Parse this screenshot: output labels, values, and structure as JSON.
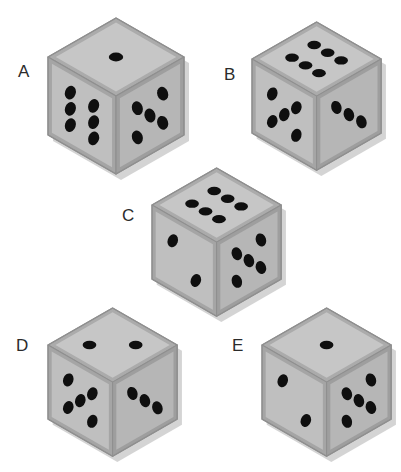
{
  "figure": {
    "type": "dice-set-illustration",
    "background_color": "#ffffff",
    "width": 401,
    "height": 472,
    "label_color": "#2b2b2b",
    "pip_color": "#0f0f0f"
  },
  "palette": {
    "face_top": "#c6c6c6",
    "face_left": "#bfbfbf",
    "face_right": "#b6b6b6",
    "rim_top": "#ababab",
    "rim_left": "#a5a5a5",
    "rim_right": "#9e9e9e",
    "outline": "#8f8f8f",
    "shadow": "#b0b0b0",
    "pip": "#0f0f0f",
    "label": "#2b2b2b"
  },
  "dice": [
    {
      "id": "A",
      "label": "A",
      "label_x": 18,
      "label_y": 63,
      "origin_x": 48,
      "origin_y": 18,
      "scale": 1.0,
      "faces": {
        "top": {
          "pips": 1,
          "name": "one"
        },
        "left": {
          "pips": 6,
          "name": "six"
        },
        "right": {
          "pips": 5,
          "name": "five"
        }
      }
    },
    {
      "id": "B",
      "label": "B",
      "label_x": 224,
      "label_y": 66,
      "origin_x": 252,
      "origin_y": 22,
      "scale": 0.95,
      "faces": {
        "top": {
          "pips": 6,
          "name": "six"
        },
        "left": {
          "pips": 5,
          "name": "five"
        },
        "right": {
          "pips": 3,
          "name": "three"
        }
      }
    },
    {
      "id": "C",
      "label": "C",
      "label_x": 122,
      "label_y": 207,
      "origin_x": 152,
      "origin_y": 168,
      "scale": 0.95,
      "faces": {
        "top": {
          "pips": 6,
          "name": "six"
        },
        "left": {
          "pips": 2,
          "name": "two"
        },
        "right": {
          "pips": 5,
          "name": "five"
        }
      }
    },
    {
      "id": "D",
      "label": "D",
      "label_x": 16,
      "label_y": 337,
      "origin_x": 48,
      "origin_y": 308,
      "scale": 0.95,
      "faces": {
        "top": {
          "pips": 2,
          "name": "two"
        },
        "left": {
          "pips": 5,
          "name": "five"
        },
        "right": {
          "pips": 3,
          "name": "three"
        }
      }
    },
    {
      "id": "E",
      "label": "E",
      "label_x": 232,
      "label_y": 337,
      "origin_x": 262,
      "origin_y": 308,
      "scale": 0.95,
      "faces": {
        "top": {
          "pips": 1,
          "name": "one"
        },
        "left": {
          "pips": 2,
          "name": "two"
        },
        "right": {
          "pips": 5,
          "name": "five"
        }
      }
    }
  ],
  "pip_layouts": {
    "1": [
      [
        0.5,
        0.5
      ]
    ],
    "2": [
      [
        0.26,
        0.26
      ],
      [
        0.74,
        0.74
      ]
    ],
    "3": [
      [
        0.24,
        0.24
      ],
      [
        0.5,
        0.5
      ],
      [
        0.76,
        0.76
      ]
    ],
    "5": [
      [
        0.25,
        0.25
      ],
      [
        0.75,
        0.25
      ],
      [
        0.5,
        0.5
      ],
      [
        0.25,
        0.75
      ],
      [
        0.75,
        0.75
      ]
    ],
    "6": [
      [
        0.27,
        0.22
      ],
      [
        0.73,
        0.22
      ],
      [
        0.27,
        0.5
      ],
      [
        0.73,
        0.5
      ],
      [
        0.27,
        0.78
      ],
      [
        0.73,
        0.78
      ]
    ]
  }
}
